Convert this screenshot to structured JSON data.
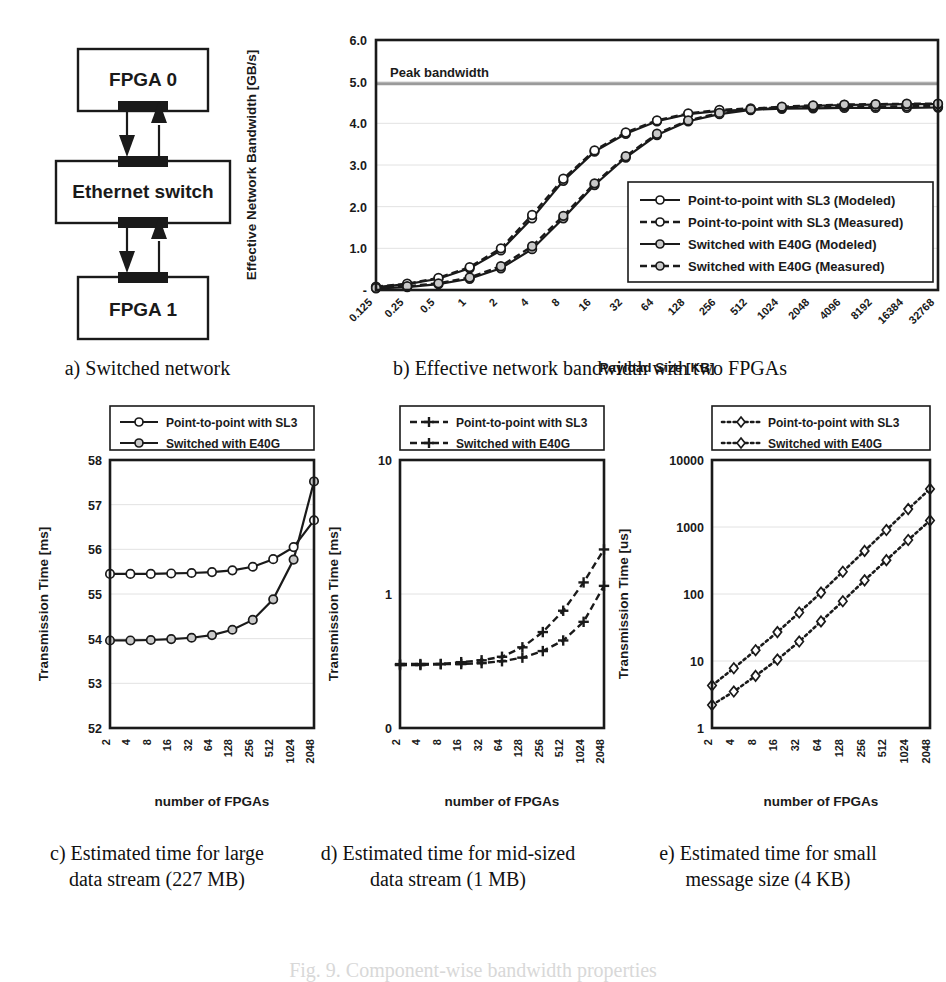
{
  "figure": {
    "bottom_caption": "Fig. 9.  Component-wise bandwidth properties",
    "subcaptions": {
      "a": "a) Switched network",
      "b": "b) Effective network bandwidth with two FPGAs",
      "c": "c) Estimated time for large\ndata stream (227 MB)",
      "c_line1": "c) Estimated time for large",
      "c_line2": "data stream (227 MB)",
      "d_line1": "d) Estimated time for mid-sized",
      "d_line2": "data stream (1 MB)",
      "e_line1": "e) Estimated time for small",
      "e_line2": "message size (4 KB)"
    }
  },
  "diagram": {
    "nodes": [
      {
        "id": "fpga0",
        "label": "FPGA 0"
      },
      {
        "id": "switch",
        "label": "Ethernet switch"
      },
      {
        "id": "fpga1",
        "label": "FPGA 1"
      }
    ],
    "links": [
      {
        "from": "fpga0",
        "to": "switch",
        "direction": "down"
      },
      {
        "from": "switch",
        "to": "fpga0",
        "direction": "up"
      },
      {
        "from": "switch",
        "to": "fpga1",
        "direction": "down"
      },
      {
        "from": "fpga1",
        "to": "switch",
        "direction": "up"
      }
    ]
  },
  "chart_data": [
    {
      "id": "panel-b",
      "type": "line",
      "title": "",
      "xlabel": "Payload Size [KB]",
      "ylabel": "Effective Network Bandwidth [GB/s]",
      "xscale": "log2-categorical",
      "categories": [
        "0.125",
        "0.25",
        "0.5",
        "1",
        "2",
        "4",
        "8",
        "16",
        "32",
        "64",
        "128",
        "256",
        "512",
        "1024",
        "2048",
        "4096",
        "8192",
        "16384",
        "32768"
      ],
      "ylim": [
        0,
        6
      ],
      "yticks": [
        "-",
        "1.0",
        "2.0",
        "3.0",
        "4.0",
        "5.0",
        "6.0"
      ],
      "ytick_values": [
        0,
        1,
        2,
        3,
        4,
        5,
        6
      ],
      "grid": true,
      "annotations": [
        {
          "text": "Peak bandwidth",
          "y": 4.95
        }
      ],
      "peak_bandwidth": 4.95,
      "legend_position": "inside-bottom-right",
      "series": [
        {
          "name": "Point-to-point with SL3 (Modeled)",
          "style": "solid",
          "marker": "circle-open",
          "values": [
            0.07,
            0.14,
            0.27,
            0.52,
            0.95,
            1.72,
            2.62,
            3.32,
            3.75,
            4.05,
            4.22,
            4.3,
            4.33,
            4.35,
            4.36,
            4.37,
            4.37,
            4.37,
            4.38
          ]
        },
        {
          "name": "Point-to-point with SL3 (Measured)",
          "style": "dashed",
          "marker": "circle-open",
          "values": [
            0.08,
            0.15,
            0.29,
            0.55,
            1.0,
            1.8,
            2.67,
            3.35,
            3.78,
            4.07,
            4.24,
            4.32,
            4.36,
            4.38,
            4.39,
            4.4,
            4.4,
            4.41,
            4.41
          ]
        },
        {
          "name": "Switched with E40G (Modeled)",
          "style": "solid",
          "marker": "circle-grey",
          "values": [
            0.04,
            0.07,
            0.14,
            0.27,
            0.52,
            0.98,
            1.72,
            2.52,
            3.18,
            3.72,
            4.05,
            4.22,
            4.32,
            4.38,
            4.42,
            4.44,
            4.45,
            4.46,
            4.46
          ]
        },
        {
          "name": "Switched with E40G (Measured)",
          "style": "dashed",
          "marker": "circle-grey",
          "values": [
            0.05,
            0.09,
            0.16,
            0.3,
            0.57,
            1.05,
            1.78,
            2.56,
            3.21,
            3.75,
            4.07,
            4.25,
            4.34,
            4.4,
            4.43,
            4.45,
            4.46,
            4.47,
            4.47
          ]
        }
      ]
    },
    {
      "id": "panel-c",
      "type": "line",
      "xlabel": "number of FPGAs",
      "ylabel": "Transmission Time [ms]",
      "categories": [
        "2",
        "4",
        "8",
        "16",
        "32",
        "64",
        "128",
        "256",
        "512",
        "1024",
        "2048"
      ],
      "ylim": [
        52,
        58
      ],
      "yticks": [
        "52",
        "53",
        "54",
        "55",
        "56",
        "57",
        "58"
      ],
      "grid": true,
      "legend_position": "above-plot",
      "series": [
        {
          "name": "Point-to-point with SL3",
          "style": "solid",
          "marker": "circle-open",
          "values": [
            55.45,
            55.45,
            55.45,
            55.46,
            55.47,
            55.49,
            55.53,
            55.61,
            55.78,
            56.05,
            56.65
          ]
        },
        {
          "name": "Switched with E40G",
          "style": "solid",
          "marker": "circle-grey",
          "values": [
            53.96,
            53.96,
            53.97,
            53.99,
            54.02,
            54.08,
            54.2,
            54.42,
            54.88,
            55.77,
            57.52
          ]
        }
      ]
    },
    {
      "id": "panel-d",
      "type": "line",
      "xlabel": "number of FPGAs",
      "ylabel": "Transmission Time [ms]",
      "categories": [
        "2",
        "4",
        "8",
        "16",
        "32",
        "64",
        "128",
        "256",
        "512",
        "1024",
        "2048"
      ],
      "yscale": "log",
      "ylim": [
        0.1,
        10
      ],
      "yticks": [
        "0",
        "1",
        "10"
      ],
      "ytick_values": [
        0.1,
        1,
        10
      ],
      "grid": true,
      "legend_position": "above-plot",
      "series": [
        {
          "name": "Point-to-point with SL3",
          "style": "dashed",
          "marker": "plus",
          "values": [
            0.3,
            0.3,
            0.3,
            0.31,
            0.32,
            0.34,
            0.4,
            0.52,
            0.75,
            1.22,
            2.15
          ]
        },
        {
          "name": "Switched with E40G",
          "style": "dashed",
          "marker": "plus",
          "values": [
            0.295,
            0.295,
            0.3,
            0.3,
            0.305,
            0.315,
            0.335,
            0.375,
            0.45,
            0.62,
            1.15
          ]
        }
      ]
    },
    {
      "id": "panel-e",
      "type": "line",
      "xlabel": "number of FPGAs",
      "ylabel": "Transmission Time [us]",
      "categories": [
        "2",
        "4",
        "8",
        "16",
        "32",
        "64",
        "128",
        "256",
        "512",
        "1024",
        "2048"
      ],
      "yscale": "log",
      "ylim": [
        1,
        10000
      ],
      "yticks": [
        "1",
        "10",
        "100",
        "1000",
        "10000"
      ],
      "ytick_values": [
        1,
        10,
        100,
        1000,
        10000
      ],
      "grid": true,
      "legend_position": "above-plot",
      "series": [
        {
          "name": "Point-to-point with SL3",
          "style": "dotted",
          "marker": "diamond-open",
          "values": [
            4.3,
            7.8,
            14.5,
            27,
            53,
            105,
            215,
            440,
            900,
            1850,
            3700
          ]
        },
        {
          "name": "Switched with E40G",
          "style": "dotted",
          "marker": "diamond-open",
          "values": [
            2.2,
            3.5,
            6.0,
            10.5,
            19.5,
            39,
            78,
            160,
            320,
            640,
            1250
          ]
        }
      ]
    }
  ]
}
